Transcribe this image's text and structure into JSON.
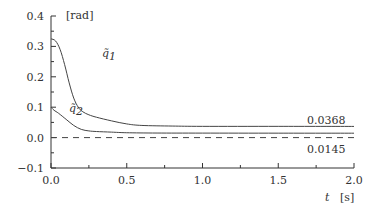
{
  "chart_data": {
    "type": "line",
    "title": "",
    "xlabel": "t",
    "xunit": "[s]",
    "ylabel": "",
    "yunit": "[rad]",
    "xlim": [
      0.0,
      2.0
    ],
    "ylim": [
      -0.1,
      0.4
    ],
    "xticks": [
      0.0,
      0.25,
      0.5,
      0.75,
      1.0,
      1.25,
      1.5,
      1.75,
      2.0
    ],
    "xtick_labels": [
      "0.0",
      "",
      "0.5",
      "",
      "1.0",
      "",
      "1.5",
      "",
      "2.0"
    ],
    "yticks": [
      -0.1,
      -0.05,
      0.0,
      0.05,
      0.1,
      0.15,
      0.2,
      0.25,
      0.3,
      0.35,
      0.4
    ],
    "ytick_labels": [
      "−0.1",
      "",
      "0.0",
      "",
      "0.1",
      "",
      "0.2",
      "",
      "0.3",
      "",
      "0.4"
    ],
    "grid": false,
    "series": [
      {
        "name": "q̃₁",
        "label_sub": "1",
        "style": "solid",
        "x": [
          0.0,
          0.03,
          0.06,
          0.09,
          0.12,
          0.15,
          0.18,
          0.21,
          0.25,
          0.3,
          0.4,
          0.5,
          0.6,
          0.8,
          1.0,
          1.5,
          2.0
        ],
        "y": [
          0.325,
          0.318,
          0.29,
          0.24,
          0.18,
          0.13,
          0.1,
          0.085,
          0.075,
          0.067,
          0.055,
          0.045,
          0.04,
          0.038,
          0.037,
          0.037,
          0.0368
        ],
        "end_annotation": "0.0368"
      },
      {
        "name": "q̃₂",
        "label_sub": "2",
        "style": "solid",
        "x": [
          0.0,
          0.02,
          0.05,
          0.1,
          0.15,
          0.2,
          0.25,
          0.3,
          0.4,
          0.5,
          0.7,
          1.0,
          1.5,
          2.0
        ],
        "y": [
          0.1,
          0.09,
          0.08,
          0.06,
          0.04,
          0.027,
          0.022,
          0.02,
          0.018,
          0.016,
          0.015,
          0.0148,
          0.0146,
          0.0145
        ],
        "end_annotation": "0.0145"
      },
      {
        "name": "zero-reference",
        "style": "dashed",
        "x": [
          0.0,
          2.0
        ],
        "y": [
          0.0,
          0.0
        ]
      }
    ],
    "labels": {
      "q1": "q̃",
      "q1_sub": "1",
      "q2": "q̃",
      "q2_sub": "2"
    }
  }
}
